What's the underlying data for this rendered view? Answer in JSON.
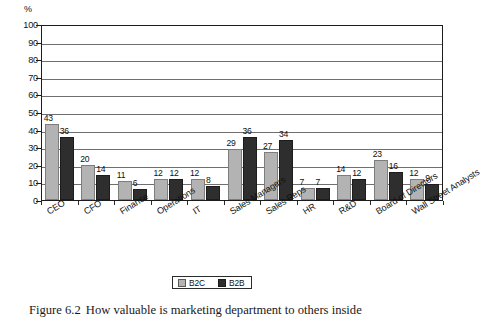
{
  "figure": {
    "caption_label": "Figure 6.2",
    "caption_text": "How valuable is marketing department to others inside"
  },
  "axis": {
    "unit_label": "%",
    "y_ticks": [
      "100",
      "90",
      "80",
      "70",
      "60",
      "50",
      "40",
      "30",
      "20",
      "10",
      "0"
    ]
  },
  "legend": {
    "items": [
      {
        "key": "b2c",
        "label": "B2C",
        "color": "#b3b3b3"
      },
      {
        "key": "b2b",
        "label": "B2B",
        "color": "#2e2e2e"
      }
    ]
  },
  "chart_data": {
    "type": "bar",
    "title": "How valuable is marketing department to others inside",
    "xlabel": "",
    "ylabel": "%",
    "ylim": [
      0,
      100
    ],
    "ytick_step": 10,
    "grid": true,
    "legend_position": "bottom-center",
    "categories": [
      "CEO",
      "CFO",
      "Finance",
      "Operations",
      "IT",
      "Sales Managers",
      "Sales Reps",
      "HR",
      "R&D",
      "Board of Directors",
      "Wall Street Analysts"
    ],
    "series": [
      {
        "name": "B2C",
        "color": "#b3b3b3",
        "values": [
          43,
          20,
          11,
          12,
          12,
          29,
          27,
          7,
          14,
          23,
          12
        ]
      },
      {
        "name": "B2B",
        "color": "#2e2e2e",
        "values": [
          36,
          14,
          6,
          12,
          8,
          36,
          34,
          7,
          12,
          16,
          9
        ]
      }
    ]
  }
}
